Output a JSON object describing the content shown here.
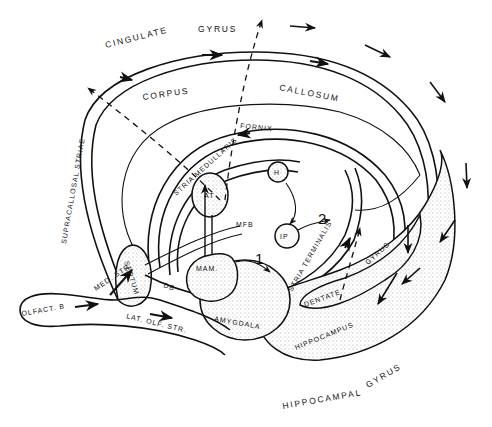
{
  "diagram": {
    "colors": {
      "ink": "#111111",
      "background": "#ffffff"
    },
    "structures": {
      "cingulate_gyrus_1": "CINGULATE",
      "cingulate_gyrus_2": "GYRUS",
      "corpus": "CORPUS",
      "callosum": "CALLOSUM",
      "fornix": "FORNIX",
      "stria_medullaris": "STRIA MEDULLARIS",
      "supracallosal_striae": "SUPRACALLOSAL STRIAE",
      "septum": "SEPTUM",
      "at": "AT",
      "h": "H",
      "ip": "IP",
      "mfb": "MFB",
      "mam": "MAM.",
      "med_str": "MED. STR.",
      "db": "DB",
      "olfact_b": "OLFACT. B",
      "lat_olf_str": "LAT. OLF. STR.",
      "amygdala": "AMYGDALA",
      "stria_terminalis": "STRIA TERMINALIS",
      "dentate": "DENTATE",
      "gyrus_dentate": "GYRUS",
      "hippocampus": "HIPPOCAMPUS",
      "hippocampal_gyrus_1": "HIPPOCAMPAL",
      "hippocampal_gyrus_2": "GYRUS"
    },
    "outputs": {
      "one": "1",
      "two": "2"
    }
  }
}
